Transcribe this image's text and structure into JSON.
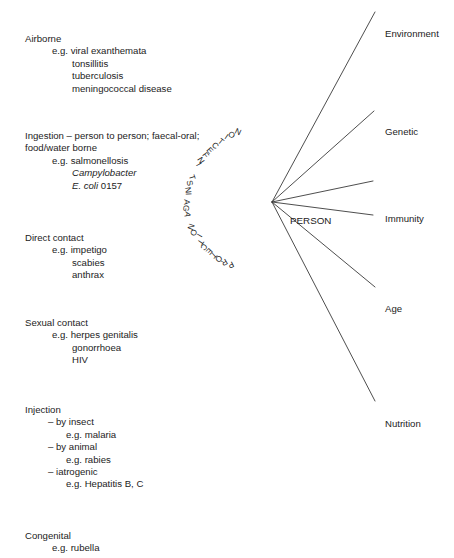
{
  "page": {
    "header": "Transmission route",
    "width": 454,
    "height": 558,
    "text_color": "#1c1c1c",
    "line_color": "#3a3a3a",
    "background": "#ffffff"
  },
  "routes": [
    {
      "title": "Airborne",
      "eg": "e.g. viral exanthemata",
      "items": [
        "tonsillitis",
        "tuberculosis",
        "meningococcal disease"
      ]
    },
    {
      "title": "Ingestion – person to person; faecal-oral; food/water borne",
      "eg": "e.g. salmonellosis",
      "items": [
        "Campylobacter",
        "E. coli 0157"
      ]
    },
    {
      "title": "Direct contact",
      "eg": "e.g. impetigo",
      "items": [
        "scabies",
        "anthrax"
      ]
    },
    {
      "title": "Sexual contact",
      "eg": "e.g. herpes genitalis",
      "items": [
        "gonorrhoea",
        "HIV"
      ]
    },
    {
      "title": "Injection",
      "subgroups": [
        {
          "dash": "– by insect",
          "eg": "e.g. malaria"
        },
        {
          "dash": "– by animal",
          "eg": "e.g. rabies"
        },
        {
          "dash": "– iatrogenic",
          "eg": "e.g. Hepatitis B, C"
        }
      ]
    },
    {
      "title": "Congenital",
      "eg": "e.g. rubella",
      "items": []
    }
  ],
  "diagram": {
    "arc_text": "PROTECTION AGAINST INFECTION",
    "center_label": "PERSON",
    "factors": [
      {
        "label": "Environment",
        "ray": "environment"
      },
      {
        "label": "Genetic",
        "ray": "genetic"
      },
      {
        "label": "Immunity",
        "ray": "immunity"
      },
      {
        "label": "Age",
        "ray": "age"
      },
      {
        "label": "Nutrition",
        "ray": "nutrition"
      }
    ]
  }
}
